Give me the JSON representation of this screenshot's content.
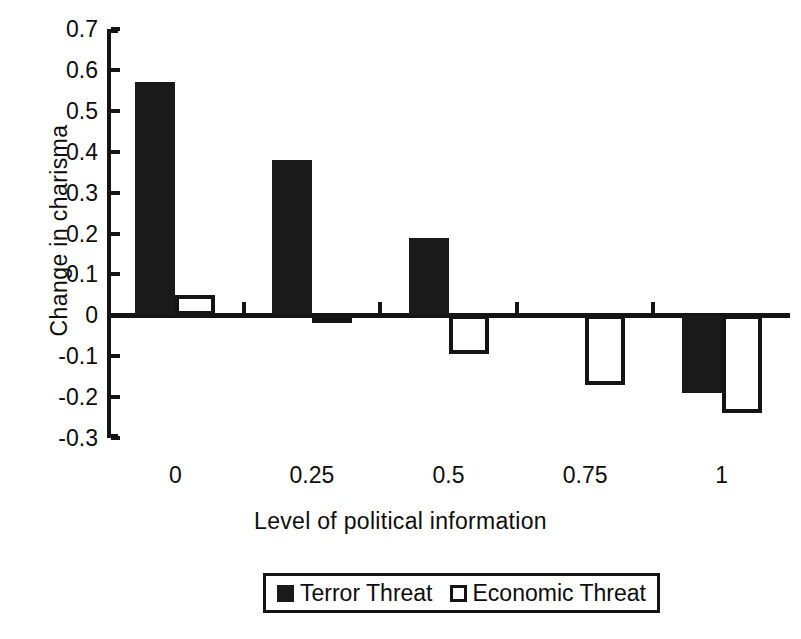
{
  "chart_data": {
    "type": "bar",
    "title": "",
    "xlabel": "Level of political information",
    "ylabel": "Change in charisma",
    "categories": [
      "0",
      "0.25",
      "0.5",
      "0.75",
      "1"
    ],
    "series": [
      {
        "name": "Terror Threat",
        "style": "filled",
        "values": [
          0.57,
          0.38,
          0.19,
          0.0,
          -0.19
        ]
      },
      {
        "name": "Economic Threat",
        "style": "hollow",
        "values": [
          0.05,
          -0.02,
          -0.095,
          -0.17,
          -0.24
        ]
      }
    ],
    "ylim": [
      -0.3,
      0.7
    ],
    "yticks": [
      "0.7",
      "0.6",
      "0.5",
      "0.4",
      "0.3",
      "0.2",
      "0.1",
      "0",
      "-0.1",
      "-0.2",
      "-0.3"
    ],
    "ytick_values": [
      0.7,
      0.6,
      0.5,
      0.4,
      0.3,
      0.2,
      0.1,
      0,
      -0.1,
      -0.2,
      -0.3
    ],
    "grid": false,
    "legend_position": "bottom-center",
    "colors": {
      "filled": "#1a1a1a",
      "hollow": "#ffffff",
      "axis": "#141414",
      "background": "#ffffff"
    }
  }
}
